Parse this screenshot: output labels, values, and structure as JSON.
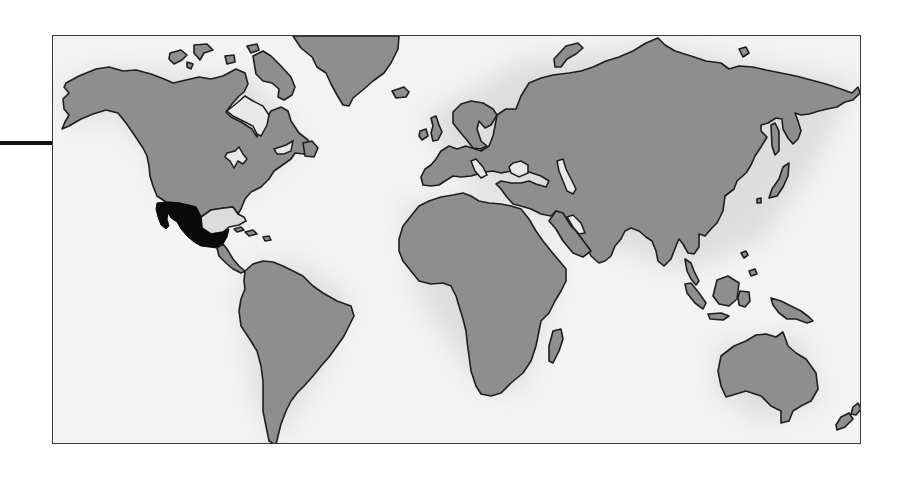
{
  "figure": {
    "type": "world-map",
    "highlighted_region": "Mexico and Central America",
    "colors": {
      "land": "#8e8e8e",
      "ocean": "#f3f3f3",
      "coastline": "#1e1e1e",
      "highlight": "#0a0a0a",
      "frame": "#3a3a3a",
      "connector": "#111111"
    },
    "continents": [
      "North America",
      "South America",
      "Greenland",
      "Europe",
      "Africa",
      "Asia",
      "Australia"
    ],
    "labels": []
  }
}
